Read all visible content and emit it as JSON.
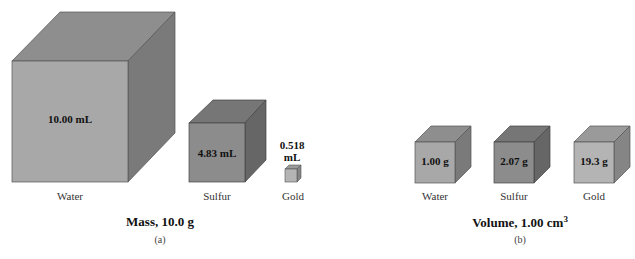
{
  "panel_a": {
    "title": "Mass, 10.0 g",
    "caption": "(a)",
    "cubes": [
      {
        "name": "Water",
        "value": "10.00 mL"
      },
      {
        "name": "Sulfur",
        "value": "4.83 mL"
      },
      {
        "name": "Gold",
        "value_line1": "0.518",
        "value_line2": "mL"
      }
    ]
  },
  "panel_b": {
    "title": "Volume, 1.00 cm",
    "title_sup": "3",
    "caption": "(b)",
    "cubes": [
      {
        "name": "Water",
        "value": "1.00 g"
      },
      {
        "name": "Sulfur",
        "value": "2.07 g"
      },
      {
        "name": "Gold",
        "value": "19.3 g"
      }
    ]
  },
  "colors": {
    "water_front": "#a8a8a8",
    "water_top": "#8e8e8e",
    "water_side": "#7a7a7a",
    "sulfur_front": "#8c8c8c",
    "sulfur_top": "#767676",
    "sulfur_side": "#666666",
    "gold_front": "#b4b4b4",
    "gold_top": "#9a9a9a",
    "gold_side": "#858585"
  }
}
